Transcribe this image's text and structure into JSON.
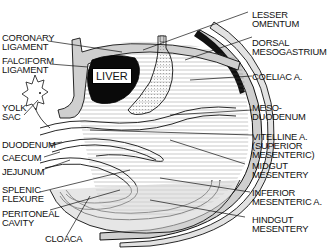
{
  "diagram": {
    "type": "anatomical-illustration",
    "organ_label": "LIVER",
    "colors": {
      "ink": "#111111",
      "mesentery_gray": "#c8c8c8",
      "liver_black": "#0a0a0a",
      "background": "#ffffff"
    },
    "labels_left": [
      {
        "id": "coronary",
        "text": "CORONARY\nLIGAMENT"
      },
      {
        "id": "falciform",
        "text": "FALCIFORM\nLIGAMENT"
      },
      {
        "id": "yolk_sac",
        "text": "YOLK\nSAC"
      },
      {
        "id": "duodenum",
        "text": "DUODENUM"
      },
      {
        "id": "caecum",
        "text": "CAECUM"
      },
      {
        "id": "jejunum",
        "text": "JEJUNUM"
      },
      {
        "id": "splenic",
        "text": "SPLENIC\nFLEXURE"
      },
      {
        "id": "peritoneal",
        "text": "PERITONEAL\nCAVITY"
      },
      {
        "id": "cloaca",
        "text": "CLOACA"
      }
    ],
    "labels_right": [
      {
        "id": "lesser_omentum",
        "text": "LESSER\nOMENTUM"
      },
      {
        "id": "dorsal_meso",
        "text": "DORSAL\nMESOGASTRIUM"
      },
      {
        "id": "coeliac",
        "text": "COELIAC A."
      },
      {
        "id": "mesoduodenum",
        "text": "MESO-\nDUODENUM"
      },
      {
        "id": "vitelline",
        "text": "VITELLINE A.\n(SUPERIOR\nMESENTERIC)"
      },
      {
        "id": "midgut_mes",
        "text": "MIDGUT\nMESENTERY"
      },
      {
        "id": "inferior_mes",
        "text": "INFERIOR\nMESENTERIC A."
      },
      {
        "id": "hindgut_mes",
        "text": "HINDGUT\nMESENTERY"
      }
    ]
  }
}
